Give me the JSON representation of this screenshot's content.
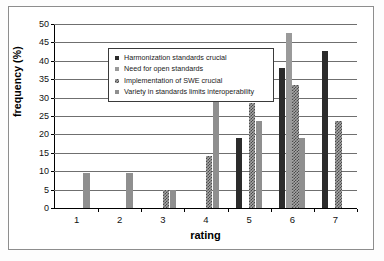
{
  "chart_data": {
    "type": "bar",
    "title": "",
    "xlabel": "rating",
    "ylabel": "frequency (%)",
    "categories": [
      "1",
      "2",
      "3",
      "4",
      "5",
      "6",
      "7"
    ],
    "ylim": [
      0,
      50
    ],
    "yticks": [
      0,
      5,
      10,
      15,
      20,
      25,
      30,
      35,
      40,
      45,
      50
    ],
    "ytick_labels": [
      "0",
      "5",
      "10",
      "15",
      "20",
      "25",
      "30",
      "35",
      "40",
      "45",
      "50"
    ],
    "grid": "horizontal",
    "legend_position": "upper-left-inside",
    "series": [
      {
        "name": "Harmonization standards crucial",
        "color": "#2b2b2b",
        "pattern": "solid",
        "values": [
          0,
          0,
          0,
          0,
          19.0,
          38.0,
          42.7
        ]
      },
      {
        "name": "Need for open standards",
        "color": "#9a9a9a",
        "pattern": "solid",
        "values": [
          0,
          0,
          0,
          0,
          0,
          47.5,
          0
        ]
      },
      {
        "name": "Implementation of SWE crucial",
        "color": "#a6a6a6",
        "pattern": "checkered",
        "values": [
          0,
          0,
          4.9,
          14.2,
          28.5,
          33.3,
          23.7
        ]
      },
      {
        "name": "Variety in standards limits interoperability",
        "color": "#8f8f8f",
        "pattern": "solid",
        "values": [
          9.5,
          9.5,
          4.9,
          33.3,
          23.7,
          19.0,
          0
        ]
      }
    ]
  },
  "legend": {
    "items": [
      "Harmonization standards crucial",
      "Need for open standards",
      "Implementation of SWE crucial",
      "Variety in standards limits interoperability"
    ]
  },
  "axes": {
    "y_title": "frequency (%)",
    "x_title": "rating"
  }
}
